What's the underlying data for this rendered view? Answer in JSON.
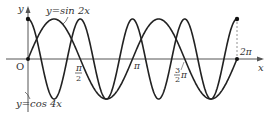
{
  "figure": {
    "axes": {
      "x_label": "x",
      "y_label": "y",
      "origin_label": "O"
    },
    "tick_labels": {
      "half_pi_num": "π",
      "half_pi_den": "2",
      "pi": "π",
      "three_half_num": "3",
      "three_half_den": "2",
      "three_half_pi": "π",
      "two_pi": "2π"
    },
    "curve_labels": {
      "sin": "y=sin 2x",
      "cos": "y=cos 4x"
    },
    "colors": {
      "curve": "#222222",
      "axis": "#555555"
    }
  },
  "chart_data": {
    "type": "line",
    "title": "",
    "xlabel": "x",
    "ylabel": "y",
    "xlim": [
      0,
      6.2832
    ],
    "ylim": [
      -1,
      1
    ],
    "x_ticks": [
      "0",
      "π/2",
      "π",
      "3π/2",
      "2π"
    ],
    "series": [
      {
        "name": "y=sin 2x",
        "function": "sin(2x)",
        "domain": [
          0,
          6.2832
        ]
      },
      {
        "name": "y=cos 4x",
        "function": "cos(4x)",
        "domain": [
          0,
          6.2832
        ]
      }
    ],
    "grid": false
  }
}
